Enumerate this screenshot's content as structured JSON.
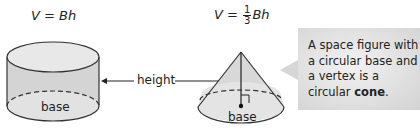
{
  "cylinder": {
    "formula_lhs": "V",
    "formula_eq": " = ",
    "formula_rhs": "Bh",
    "base_label": "base"
  },
  "cone": {
    "formula_lhs": "V",
    "formula_eq": " = ",
    "fraction_numerator": "1",
    "fraction_denominator": "3",
    "formula_rhs": "Bh",
    "base_label": "base"
  },
  "height_label": "height",
  "callout": {
    "text_before": "A space figure with a circular base and a vertex is a circular ",
    "term": "cone",
    "text_after": "."
  },
  "colors": {
    "solid_fill": "#d4d4d4",
    "base_fill": "#e6e6e6",
    "stroke": "#333333",
    "callout_fill": "#dcdcdc"
  }
}
